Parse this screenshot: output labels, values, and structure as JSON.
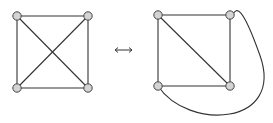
{
  "diagram": {
    "relation_symbol": "↔",
    "left_graph": {
      "name": "K4 with crossing diagonals",
      "nodes": [
        "top-left",
        "top-right",
        "bottom-left",
        "bottom-right"
      ],
      "edges": [
        [
          "top-left",
          "top-right"
        ],
        [
          "top-left",
          "bottom-left"
        ],
        [
          "top-right",
          "bottom-right"
        ],
        [
          "bottom-left",
          "bottom-right"
        ],
        [
          "top-left",
          "bottom-right"
        ],
        [
          "top-right",
          "bottom-left"
        ]
      ]
    },
    "right_graph": {
      "name": "K4 planar embedding",
      "nodes": [
        "top-left",
        "top-right",
        "bottom-left",
        "bottom-right"
      ],
      "edges": [
        [
          "top-left",
          "top-right"
        ],
        [
          "top-left",
          "bottom-left"
        ],
        [
          "top-right",
          "bottom-right"
        ],
        [
          "bottom-left",
          "bottom-right"
        ],
        [
          "top-left",
          "bottom-right"
        ],
        [
          "bottom-left",
          "top-right",
          "curved"
        ]
      ]
    },
    "colors": {
      "edge": "#333333",
      "node_fill": "#d4d4d4",
      "node_stroke": "#444444"
    }
  }
}
